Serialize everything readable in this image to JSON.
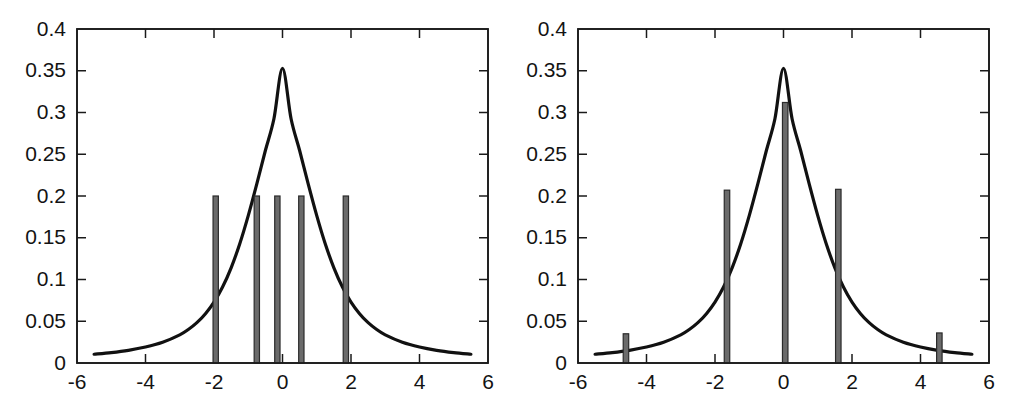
{
  "figure": {
    "background": "#ffffff",
    "panel_count": 2,
    "curve_color": "#111111",
    "bar_fill_color": "#6b6b6b",
    "bar_edge_color": "#2b2b2b",
    "axis_color": "#1a1a1a"
  },
  "chart_data": [
    {
      "panel": "left",
      "type": "bar",
      "title": "",
      "subtitle": "",
      "xlabel": "",
      "ylabel": "",
      "xlim": [
        -6,
        6
      ],
      "ylim": [
        0,
        0.4
      ],
      "grid": false,
      "legend": null,
      "legend_position": "none",
      "xticks": [
        -6,
        -4,
        -2,
        0,
        2,
        4,
        6
      ],
      "xticklabels": [
        "-6",
        "-4",
        "-2",
        "0",
        "2",
        "4",
        "6"
      ],
      "yticks": [
        0,
        0.05,
        0.1,
        0.15,
        0.2,
        0.25,
        0.3,
        0.35,
        0.4
      ],
      "yticklabels": [
        "0",
        "0.05",
        "0.1",
        "0.15",
        "0.2",
        "0.25",
        "0.3",
        "0.35",
        "0.4"
      ],
      "bar_width": 0.155,
      "x": [
        -1.95,
        -0.75,
        -0.15,
        0.55,
        1.85
      ],
      "values": [
        0.2,
        0.2,
        0.2,
        0.2,
        0.2
      ],
      "series": [
        {
          "name": "samples",
          "type": "bar",
          "x": [
            -1.95,
            -0.75,
            -0.15,
            0.55,
            1.85
          ],
          "values": [
            0.2,
            0.2,
            0.2,
            0.2,
            0.2
          ]
        },
        {
          "name": "density curve",
          "type": "line",
          "peak_x": 0,
          "peak_y": 0.353,
          "tail_y_at_minus5_5": 0.0105,
          "tail_y_at_plus5_5": 0.0105,
          "x": [
            -5.5,
            -5.0,
            -4.5,
            -4.0,
            -3.5,
            -3.0,
            -2.75,
            -2.5,
            -2.25,
            -2.0,
            -1.75,
            -1.5,
            -1.25,
            -1.0,
            -0.75,
            -0.5,
            -0.25,
            0.0,
            0.25,
            0.5,
            0.75,
            1.0,
            1.25,
            1.5,
            1.75,
            2.0,
            2.25,
            2.5,
            2.75,
            3.0,
            3.5,
            4.0,
            4.5,
            5.0,
            5.5
          ],
          "y": [
            0.0105,
            0.0125,
            0.0152,
            0.0191,
            0.0248,
            0.0337,
            0.0401,
            0.0483,
            0.0591,
            0.073,
            0.091,
            0.114,
            0.1425,
            0.1765,
            0.2145,
            0.2545,
            0.2925,
            0.353,
            0.2925,
            0.2545,
            0.2145,
            0.1765,
            0.1425,
            0.114,
            0.091,
            0.073,
            0.0591,
            0.0483,
            0.0401,
            0.0337,
            0.0248,
            0.0191,
            0.0152,
            0.0125,
            0.0105
          ]
        }
      ]
    },
    {
      "panel": "right",
      "type": "bar",
      "title": "",
      "subtitle": "",
      "xlabel": "",
      "ylabel": "",
      "xlim": [
        -6,
        6
      ],
      "ylim": [
        0,
        0.4
      ],
      "grid": false,
      "legend": null,
      "legend_position": "none",
      "xticks": [
        -6,
        -4,
        -2,
        0,
        2,
        4,
        6
      ],
      "xticklabels": [
        "-6",
        "-4",
        "-2",
        "0",
        "2",
        "4",
        "6"
      ],
      "yticks": [
        0,
        0.05,
        0.1,
        0.15,
        0.2,
        0.25,
        0.3,
        0.35,
        0.4
      ],
      "yticklabels": [
        "0",
        "0.05",
        "0.1",
        "0.15",
        "0.2",
        "0.25",
        "0.3",
        "0.35",
        "0.4"
      ],
      "bar_width": 0.16,
      "x": [
        -4.6,
        -1.65,
        0.05,
        1.6,
        4.55
      ],
      "values": [
        0.035,
        0.207,
        0.312,
        0.208,
        0.036
      ],
      "series": [
        {
          "name": "weighted samples",
          "type": "bar",
          "x": [
            -4.6,
            -1.65,
            0.05,
            1.6,
            4.55
          ],
          "values": [
            0.035,
            0.207,
            0.312,
            0.208,
            0.036
          ]
        },
        {
          "name": "density curve",
          "type": "line",
          "peak_x": 0,
          "peak_y": 0.353,
          "tail_y_at_minus5_5": 0.0105,
          "tail_y_at_plus5_5": 0.0105,
          "x": [
            -5.5,
            -5.0,
            -4.5,
            -4.0,
            -3.5,
            -3.0,
            -2.75,
            -2.5,
            -2.25,
            -2.0,
            -1.75,
            -1.5,
            -1.25,
            -1.0,
            -0.75,
            -0.5,
            -0.25,
            0.0,
            0.25,
            0.5,
            0.75,
            1.0,
            1.25,
            1.5,
            1.75,
            2.0,
            2.25,
            2.5,
            2.75,
            3.0,
            3.5,
            4.0,
            4.5,
            5.0,
            5.5
          ],
          "y": [
            0.0105,
            0.0125,
            0.0152,
            0.0191,
            0.0248,
            0.0337,
            0.0401,
            0.0483,
            0.0591,
            0.073,
            0.091,
            0.114,
            0.1425,
            0.1765,
            0.2145,
            0.2545,
            0.2925,
            0.353,
            0.2925,
            0.2545,
            0.2145,
            0.1765,
            0.1425,
            0.114,
            0.091,
            0.073,
            0.0591,
            0.0483,
            0.0401,
            0.0337,
            0.0248,
            0.0191,
            0.0152,
            0.0125,
            0.0105
          ]
        }
      ]
    }
  ]
}
